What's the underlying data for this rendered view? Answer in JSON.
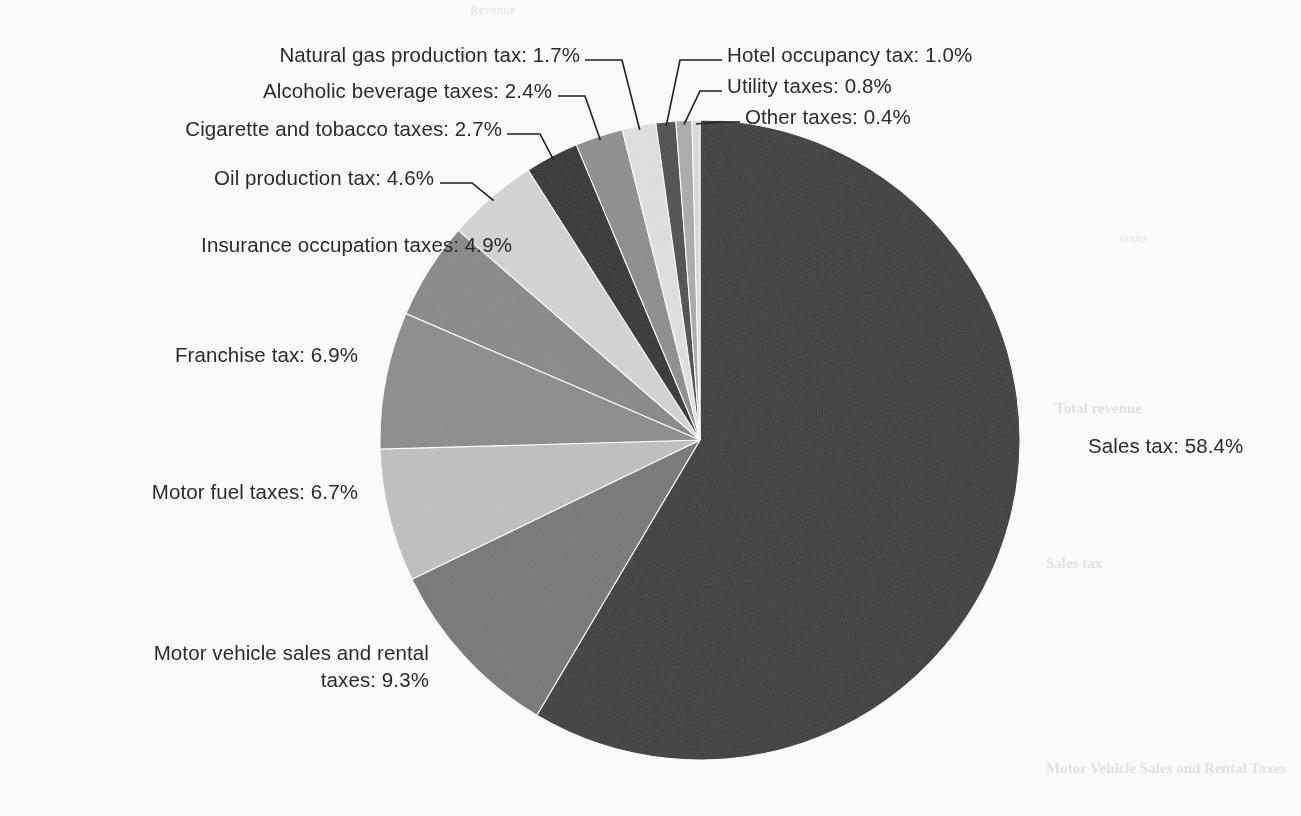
{
  "page": {
    "background_color": "#fdfdfb",
    "text_color": "#2b2b2b",
    "ghost_text": [
      "Revenue",
      "Sales tax",
      "Total revenue",
      "taxes",
      "Motor Vehicle Sales and Rental Taxes"
    ]
  },
  "chart_data": {
    "type": "pie",
    "title": "",
    "subtitle": "",
    "xlabel": "",
    "ylabel": "",
    "legend_position": "callout-labels",
    "grid": false,
    "start_angle_deg": 0,
    "direction": "clockwise",
    "units": "percent",
    "total": 100.0,
    "categories": [
      "Sales tax",
      "Motor vehicle sales and rental taxes",
      "Motor fuel taxes",
      "Franchise tax",
      "Insurance occupation taxes",
      "Oil production tax",
      "Cigarette and tobacco taxes",
      "Alcoholic beverage taxes",
      "Natural gas production tax",
      "Hotel occupancy tax",
      "Utility taxes",
      "Other taxes"
    ],
    "values": [
      58.4,
      9.3,
      6.7,
      6.9,
      4.9,
      4.6,
      2.7,
      2.4,
      1.7,
      1.0,
      0.8,
      0.4
    ],
    "colors": [
      "#3a3a3a",
      "#787878",
      "#c2c2c2",
      "#8d8d8d",
      "#8a8a8a",
      "#d6d6d6",
      "#2e2e2e",
      "#8f8f8f",
      "#e2e2e2",
      "#4d4d4d",
      "#adadad",
      "#dcdcdc"
    ],
    "slices": [
      {
        "label": "Sales tax",
        "value": 58.4,
        "display": "Sales tax: 58.4%",
        "color": "#3a3a3a"
      },
      {
        "label": "Motor vehicle sales and rental taxes",
        "value": 9.3,
        "display": "Motor vehicle sales and rental taxes: 9.3%",
        "color": "#787878"
      },
      {
        "label": "Motor fuel taxes",
        "value": 6.7,
        "display": "Motor fuel taxes: 6.7%",
        "color": "#c2c2c2"
      },
      {
        "label": "Franchise tax",
        "value": 6.9,
        "display": "Franchise tax: 6.9%",
        "color": "#8d8d8d"
      },
      {
        "label": "Insurance occupation taxes",
        "value": 4.9,
        "display": "Insurance occupation taxes: 4.9%",
        "color": "#8a8a8a"
      },
      {
        "label": "Oil production tax",
        "value": 4.6,
        "display": "Oil production tax: 4.6%",
        "color": "#d6d6d6"
      },
      {
        "label": "Cigarette and tobacco taxes",
        "value": 2.7,
        "display": "Cigarette and tobacco taxes: 2.7%",
        "color": "#2e2e2e"
      },
      {
        "label": "Alcoholic beverage taxes",
        "value": 2.4,
        "display": "Alcoholic beverage taxes: 2.4%",
        "color": "#8f8f8f"
      },
      {
        "label": "Natural gas production tax",
        "value": 1.7,
        "display": "Natural gas production tax: 1.7%",
        "color": "#e2e2e2"
      },
      {
        "label": "Hotel occupancy tax",
        "value": 1.0,
        "display": "Hotel occupancy tax: 1.0%",
        "color": "#4d4d4d"
      },
      {
        "label": "Utility taxes",
        "value": 0.8,
        "display": "Utility taxes: 0.8%",
        "color": "#adadad"
      },
      {
        "label": "Other taxes",
        "value": 0.4,
        "display": "Other taxes: 0.4%",
        "color": "#dcdcdc"
      }
    ]
  },
  "labels": {
    "sales_tax": "Sales tax: 58.4%",
    "motor_vehicle_line1": "Motor vehicle sales and rental",
    "motor_vehicle_line2": "taxes: 9.3%",
    "motor_fuel": "Motor fuel taxes: 6.7%",
    "franchise": "Franchise tax: 6.9%",
    "insurance": "Insurance occupation taxes: 4.9%",
    "oil_production": "Oil production tax: 4.6%",
    "cigarette": "Cigarette and tobacco taxes: 2.7%",
    "alcoholic": "Alcoholic beverage taxes: 2.4%",
    "natural_gas": "Natural gas production tax: 1.7%",
    "hotel": "Hotel occupancy tax: 1.0%",
    "utility": "Utility taxes: 0.8%",
    "other": "Other taxes: 0.4%"
  }
}
